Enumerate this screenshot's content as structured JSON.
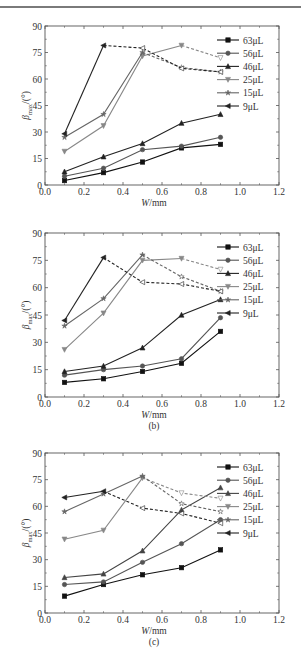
{
  "header": {
    "text": ""
  },
  "chart_data": [
    {
      "type": "line",
      "panel": "(a)",
      "title": "",
      "xlabel": "W/mm",
      "ylabel": "β_max/(°)",
      "xlim": [
        0.0,
        1.2
      ],
      "ylim": [
        0,
        90
      ],
      "xticks": [
        "0.0",
        "0.2",
        "0.4",
        "0.6",
        "0.8",
        "1.0",
        "1.2"
      ],
      "yticks": [
        "0",
        "15",
        "30",
        "45",
        "60",
        "75",
        "90"
      ],
      "grid": false,
      "legend_position": "upper right",
      "x": [
        0.1,
        0.3,
        0.5,
        0.7,
        0.9
      ],
      "series": [
        {
          "name": "63μL",
          "marker": "square",
          "color": "#111111",
          "values": [
            2.5,
            7,
            13,
            21,
            23
          ],
          "dashed_from_index": null
        },
        {
          "name": "56μL",
          "marker": "circle",
          "color": "#555555",
          "values": [
            5,
            9.5,
            20,
            22,
            27
          ],
          "dashed_from_index": null
        },
        {
          "name": "46μL",
          "marker": "triangle-up",
          "color": "#222222",
          "values": [
            7.5,
            16,
            23.5,
            35,
            40
          ],
          "dashed_from_index": null
        },
        {
          "name": "25μL",
          "marker": "triangle-down",
          "color": "#888888",
          "values": [
            19,
            33.5,
            73,
            79,
            72
          ],
          "dashed_from_index": 3
        },
        {
          "name": "15μL",
          "marker": "star",
          "color": "#666666",
          "values": [
            27,
            40,
            75,
            66.5,
            64
          ],
          "dashed_from_index": 2
        },
        {
          "name": "9μL",
          "marker": "triangle-left",
          "color": "#222222",
          "values": [
            29,
            79,
            77.5,
            66,
            64
          ],
          "dashed_from_index": 1
        }
      ]
    },
    {
      "type": "line",
      "panel": "(b)",
      "title": "",
      "xlabel": "W/mm",
      "ylabel": "β_max/(°)",
      "xlim": [
        0.0,
        1.2
      ],
      "ylim": [
        0,
        90
      ],
      "xticks": [
        "0.0",
        "0.2",
        "0.4",
        "0.6",
        "0.8",
        "1.0",
        "1.2"
      ],
      "yticks": [
        "0",
        "15",
        "30",
        "45",
        "60",
        "75",
        "90"
      ],
      "grid": false,
      "legend_position": "upper right",
      "x": [
        0.1,
        0.3,
        0.5,
        0.7,
        0.9
      ],
      "series": [
        {
          "name": "63μL",
          "marker": "square",
          "color": "#111111",
          "values": [
            8,
            10,
            14,
            18.5,
            36
          ],
          "dashed_from_index": null
        },
        {
          "name": "56μL",
          "marker": "circle",
          "color": "#555555",
          "values": [
            12,
            15,
            17,
            21,
            43.5
          ],
          "dashed_from_index": null
        },
        {
          "name": "46μL",
          "marker": "triangle-up",
          "color": "#222222",
          "values": [
            14,
            17,
            27,
            45,
            53.5
          ],
          "dashed_from_index": null
        },
        {
          "name": "25μL",
          "marker": "triangle-down",
          "color": "#888888",
          "values": [
            26,
            46,
            75,
            76,
            70
          ],
          "dashed_from_index": 3
        },
        {
          "name": "15μL",
          "marker": "star",
          "color": "#666666",
          "values": [
            39,
            54,
            78,
            66,
            58
          ],
          "dashed_from_index": 2
        },
        {
          "name": "9μL",
          "marker": "triangle-left",
          "color": "#222222",
          "values": [
            42,
            76.5,
            63,
            62,
            58
          ],
          "dashed_from_index": 1
        }
      ]
    },
    {
      "type": "line",
      "panel": "(c)",
      "title": "",
      "xlabel": "W/mm",
      "ylabel": "β_max/(°)",
      "xlim": [
        0.0,
        1.2
      ],
      "ylim": [
        0,
        90
      ],
      "xticks": [
        "0.0",
        "0.2",
        "0.4",
        "0.6",
        "0.8",
        "1.0",
        "1.2"
      ],
      "yticks": [
        "0",
        "15",
        "30",
        "45",
        "60",
        "75",
        "90"
      ],
      "grid": false,
      "legend_position": "upper right",
      "x": [
        0.1,
        0.3,
        0.5,
        0.7,
        0.9
      ],
      "series": [
        {
          "name": "63μL",
          "marker": "square",
          "color": "#111111",
          "values": [
            9.5,
            16,
            21.5,
            25.5,
            35.5
          ],
          "dashed_from_index": null
        },
        {
          "name": "56μL",
          "marker": "circle",
          "color": "#555555",
          "values": [
            16,
            17.5,
            28.5,
            39,
            52.5
          ],
          "dashed_from_index": null
        },
        {
          "name": "46μL",
          "marker": "triangle-up",
          "color": "#444444",
          "values": [
            20,
            22,
            35,
            58,
            70.5
          ],
          "dashed_from_index": null
        },
        {
          "name": "25μL",
          "marker": "triangle-down",
          "color": "#888888",
          "values": [
            41.5,
            46.5,
            76,
            67.5,
            64.5
          ],
          "dashed_from_index": 2
        },
        {
          "name": "15μL",
          "marker": "star",
          "color": "#666666",
          "values": [
            57,
            67,
            77,
            61.5,
            57
          ],
          "dashed_from_index": 2
        },
        {
          "name": "9μL",
          "marker": "triangle-left",
          "color": "#222222",
          "values": [
            65,
            68.5,
            59,
            56,
            50.5
          ],
          "dashed_from_index": 1
        }
      ]
    }
  ],
  "layout": [
    {
      "top": 16,
      "plot": {
        "x0": 45,
        "x1": 279,
        "y0": 26,
        "y1": 185
      }
    },
    {
      "top": 222,
      "plot": {
        "x0": 45,
        "x1": 279,
        "y0": 11,
        "y1": 175
      }
    },
    {
      "top": 440,
      "plot": {
        "x0": 45,
        "x1": 279,
        "y0": 13,
        "y1": 173
      }
    }
  ]
}
